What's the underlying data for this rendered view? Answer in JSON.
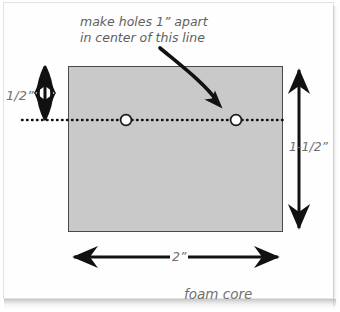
{
  "diagram": {
    "annotation": {
      "line1": "make holes 1” apart",
      "line2": "in center of this line"
    },
    "labels": {
      "height_top": "1/2”",
      "height_total": "1-1/2”",
      "width": "2”",
      "material": "foam core"
    },
    "colors": {
      "board_fill": "#c9c9c9",
      "board_stroke": "#4a4a4a",
      "line": "#111111",
      "text": "#6f6f6f",
      "hole_fill": "#ffffff",
      "card_bg": "#fefefe"
    },
    "geometry": {
      "board": {
        "x": 68,
        "y": 66,
        "width": 215,
        "height": 166
      },
      "holes": [
        {
          "cx": 126,
          "cy": 120,
          "r": 5.5
        },
        {
          "cx": 236,
          "cy": 120,
          "r": 5.5
        }
      ],
      "center_line": {
        "x1": 22,
        "y1": 120,
        "x2": 283,
        "y2": 120
      },
      "dim_top": {
        "x": 45,
        "y1": 66,
        "y2": 120
      },
      "dim_right": {
        "x": 299,
        "y1": 66,
        "y2": 232
      },
      "dim_bottom": {
        "y": 257,
        "x1": 70,
        "x2": 282
      },
      "pointer": {
        "x1": 160,
        "y1": 48,
        "x2": 222,
        "y2": 107
      }
    }
  }
}
